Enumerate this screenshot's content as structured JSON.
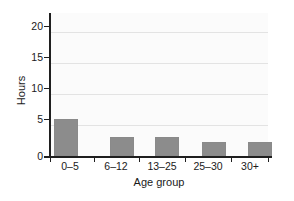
{
  "chart_data": {
    "type": "bar",
    "title": "",
    "subtitle": "",
    "categories": [
      "0–5",
      "6–12",
      "13–25",
      "25–30",
      "30+"
    ],
    "values": [
      6.0,
      3.0,
      3.1,
      2.2,
      2.2
    ],
    "xlabel": "Age group",
    "ylabel": "Hours",
    "ylim": [
      0,
      23
    ],
    "yticks": [
      0,
      5,
      10,
      15,
      20
    ],
    "ytick_labels": [
      "0",
      "5",
      "10",
      "15",
      "20"
    ],
    "grid": "horizontal",
    "legend": "none",
    "bar_color": "#8c8c8c",
    "plot_background": "#fbfbfb",
    "gridline_color": "#e3e3e3",
    "axis_color": "#1f1f1f"
  }
}
